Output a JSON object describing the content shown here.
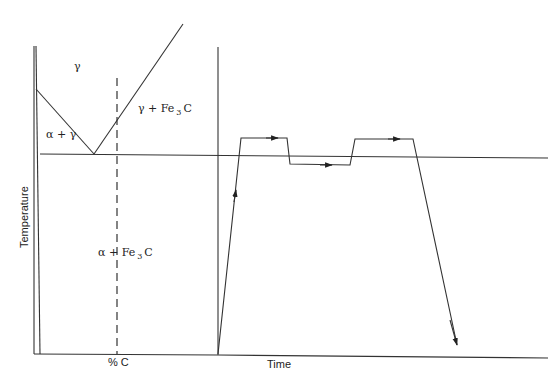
{
  "phase_diagram": {
    "axis_x_label": "% C",
    "axis_y_label": "Temperature",
    "regions": {
      "gamma": "γ",
      "alpha_gamma": "α + γ",
      "gamma_fe3c_prefix": "γ + Fe",
      "alpha_fe3c_prefix": "α + Fe",
      "fe3c_subscript": "3",
      "fe3c_suffix": "C"
    }
  },
  "heat_treatment": {
    "axis_x_label": "Time",
    "path_description": "Heat to above critical temperature, hold, drop below, hold, reheat above, hold, then quench down"
  },
  "colors": {
    "line": "#333333",
    "background": "#ffffff"
  }
}
